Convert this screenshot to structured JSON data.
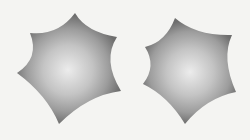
{
  "figure": {
    "shapes": [
      {
        "name": "star-shape-left",
        "type": "six-pointed concave star",
        "fill": "radial gradient gray"
      },
      {
        "name": "star-shape-right",
        "type": "six-pointed convex spiky hexagon",
        "fill": "radial gradient gray"
      }
    ],
    "colors": {
      "background": "#f4f4f2",
      "edge": "#6e6e6e",
      "mid": "#9a9a9a",
      "center": "#e8e8e8"
    }
  }
}
